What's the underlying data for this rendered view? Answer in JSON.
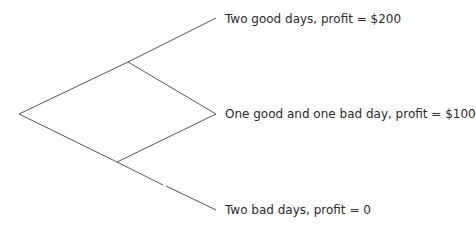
{
  "diagram": {
    "type": "binomial tree",
    "line_color": "#555555",
    "outcomes": [
      {
        "label": "Two good days, profit = $200"
      },
      {
        "label": "One good and one bad day, profit = $100"
      },
      {
        "label": "Two bad days, profit = 0"
      }
    ]
  }
}
